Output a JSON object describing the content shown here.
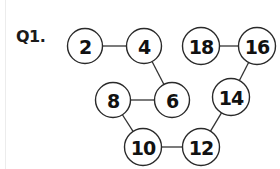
{
  "question": {
    "label": "Q1."
  },
  "diagram": {
    "nodes": [
      {
        "id": "n2",
        "value": "2",
        "cx": 85,
        "cy": 46,
        "r": 17.5
      },
      {
        "id": "n4",
        "value": "4",
        "cx": 144,
        "cy": 46,
        "r": 17.5
      },
      {
        "id": "n18",
        "value": "18",
        "cx": 201,
        "cy": 46,
        "r": 18.5
      },
      {
        "id": "n16",
        "value": "16",
        "cx": 257,
        "cy": 46,
        "r": 18.5
      },
      {
        "id": "n8",
        "value": "8",
        "cx": 113,
        "cy": 100,
        "r": 17.5
      },
      {
        "id": "n6",
        "value": "6",
        "cx": 172,
        "cy": 100,
        "r": 17.5
      },
      {
        "id": "n14",
        "value": "14",
        "cx": 231,
        "cy": 97,
        "r": 18.5
      },
      {
        "id": "n10",
        "value": "10",
        "cx": 143,
        "cy": 147,
        "r": 18.5
      },
      {
        "id": "n12",
        "value": "12",
        "cx": 201,
        "cy": 147,
        "r": 18.5
      }
    ],
    "edges": [
      [
        "n2",
        "n4"
      ],
      [
        "n4",
        "n6"
      ],
      [
        "n8",
        "n6"
      ],
      [
        "n8",
        "n10"
      ],
      [
        "n10",
        "n12"
      ],
      [
        "n12",
        "n14"
      ],
      [
        "n14",
        "n16"
      ],
      [
        "n18",
        "n16"
      ]
    ],
    "sequence": [
      "2",
      "4",
      "6",
      "8",
      "10",
      "12",
      "14",
      "16",
      "18"
    ]
  }
}
